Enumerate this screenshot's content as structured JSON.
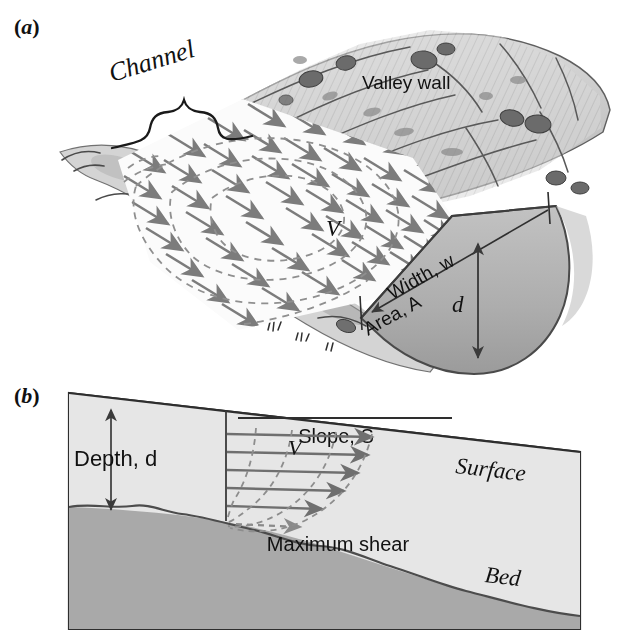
{
  "figure": {
    "type": "scientific-illustration",
    "panels": [
      {
        "id": "a",
        "label": "(a)",
        "label_letter": "a",
        "description": "Perspective sketch of a river channel within a valley, with surface velocity arrows, dashed velocity contours, and a cross-sectional cut showing width, area and depth.",
        "labels": {
          "channel": "Channel",
          "valley_wall": "Valley wall",
          "velocity": "V",
          "width": "Width, w",
          "area": "Area, A",
          "depth_symbol": "d"
        }
      },
      {
        "id": "b",
        "label": "(b)",
        "label_letter": "b",
        "description": "Longitudinal section of flowing water over a sloping bed showing the vertical velocity profile and the zone of maximum shear.",
        "labels": {
          "depth": "Depth, d",
          "slope": "Slope, S",
          "velocity": "V",
          "maximum_shear": "Maximum shear",
          "surface": "Surface",
          "bed": "Bed"
        }
      }
    ],
    "colors": {
      "ink": "#111111",
      "water_fill": "#e3e3e3",
      "bed_fill": "#a9a9a9",
      "cross_section_fill": "#b5b5b5",
      "arrow_gray": "#7c7c7c",
      "dashed_gray": "#8d8d8d",
      "terrain_light": "#d8d8d8",
      "terrain_mid": "#b0b0b0",
      "terrain_dark": "#6e6e6e",
      "background": "#ffffff"
    }
  }
}
